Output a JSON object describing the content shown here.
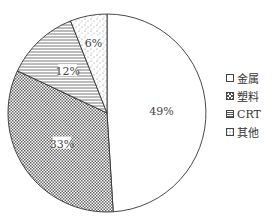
{
  "chart_data": {
    "type": "pie",
    "title": "",
    "categories": [
      "金属",
      "塑料",
      "CRT",
      "其他"
    ],
    "values": [
      49,
      33,
      12,
      6
    ],
    "labels": [
      "49%",
      "33%",
      "12%",
      "6%"
    ],
    "patterns": [
      "blank",
      "crosshatch",
      "horizontal-lines",
      "dots"
    ],
    "start_angle": "top (12 o'clock)",
    "direction": "clockwise",
    "legend_position": "right"
  },
  "legend": {
    "items": [
      {
        "label": "金属",
        "pattern": "blank"
      },
      {
        "label": "塑料",
        "pattern": "crosshatch"
      },
      {
        "label": "CRT",
        "pattern": "horizontal-lines"
      },
      {
        "label": "其他",
        "pattern": "dots"
      }
    ]
  }
}
